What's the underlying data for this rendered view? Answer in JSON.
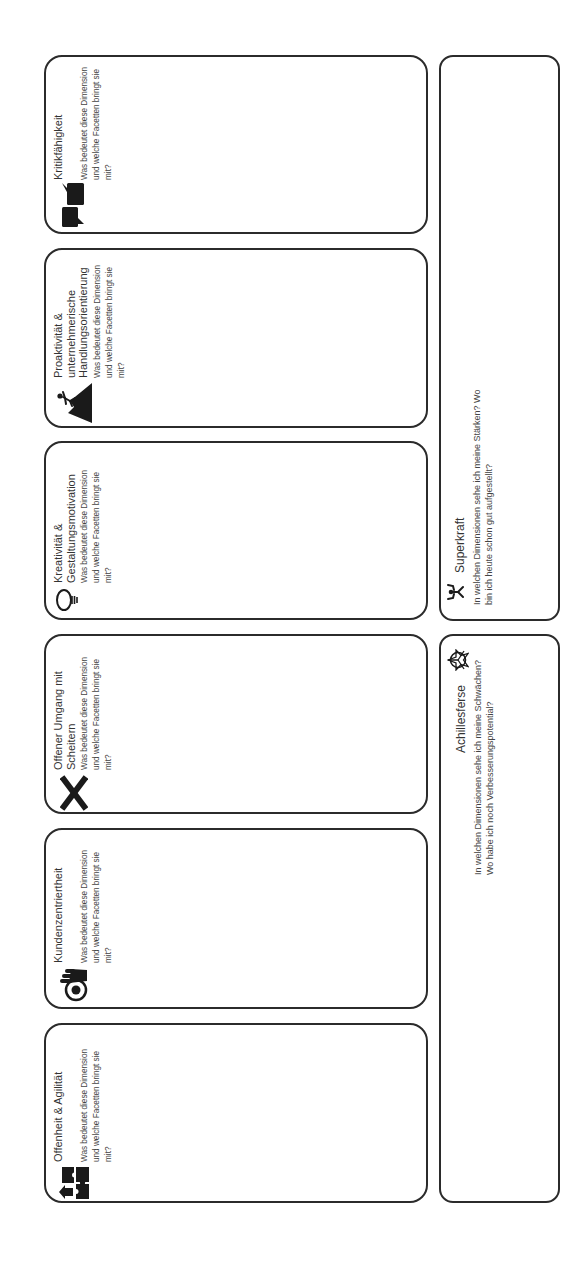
{
  "colors": {
    "background": "#ffffff",
    "border": "#2b2b2b",
    "title_text": "#333333",
    "body_text": "#444444",
    "icon": "#1a1a1a"
  },
  "dimensions": [
    {
      "icon": "puzzle-pieces-icon",
      "title_lines": [
        "Offenheit & Agilität"
      ],
      "description_lines": [
        "Was bedeutet diese Dimension",
        "und welche Facetten bringt sie",
        "mit?"
      ]
    },
    {
      "icon": "customer-target-icon",
      "title_lines": [
        "Kundenzentriertheit"
      ],
      "description_lines": [
        "Was bedeutet diese Dimension",
        "und welche Facetten bringt sie",
        "mit?"
      ]
    },
    {
      "icon": "x-mark-icon",
      "title_lines": [
        "Offener Umgang mit",
        "Scheitern"
      ],
      "description_lines": [
        "Was bedeutet diese Dimension",
        "und welche Facetten bringt sie",
        "mit?"
      ]
    },
    {
      "icon": "light-bulb-icon",
      "title_lines": [
        "Kreativität &",
        "Gestaltungsmotivation"
      ],
      "description_lines": [
        "Was bedeutet diese Dimension",
        "und welche Facetten bringt sie",
        "mit?"
      ]
    },
    {
      "icon": "climber-mountain-icon",
      "title_lines": [
        "Proaktivität &",
        "unternehmerische",
        "Handlungsorientierung"
      ],
      "description_lines": [
        "Was bedeutet diese Dimension",
        "und welche Facetten bringt sie",
        "mit?"
      ]
    },
    {
      "icon": "speech-bubbles-icon",
      "title_lines": [
        "Kritikfähigkeit"
      ],
      "description_lines": [
        "Was bedeutet diese Dimension",
        "und welche Facetten bringt sie",
        "mit?"
      ]
    }
  ],
  "reflection": {
    "superkraft": {
      "icon": "strongman-icon",
      "title": "Superkraft",
      "description_lines": [
        "In welchen Dimensionen sehe ich meine Stärken? Wo",
        "bin ich heute schon gut aufgestellt?"
      ]
    },
    "achillesferse": {
      "icon": "web-target-icon",
      "title": "Achillesferse",
      "description_lines": [
        "In welchen Dimensionen sehe ich meine Schwächen?",
        "Wo habe ich noch Verbesserungspotential?"
      ]
    }
  }
}
